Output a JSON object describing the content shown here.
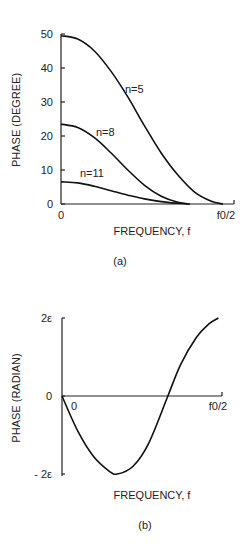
{
  "chart_data": [
    {
      "id": "a",
      "type": "line",
      "caption": "(a)",
      "title": "",
      "xlabel": "FREQUENCY, f",
      "ylabel": "PHASE (DEGREE)",
      "xlim": [
        0,
        1
      ],
      "ylim": [
        0,
        50
      ],
      "x_ticks": [
        {
          "value": 0,
          "label": "0"
        },
        {
          "value": 1,
          "label": "f0/2"
        }
      ],
      "y_ticks": [
        {
          "value": 0,
          "label": "0"
        },
        {
          "value": 10,
          "label": "10"
        },
        {
          "value": 20,
          "label": "20"
        },
        {
          "value": 30,
          "label": "30"
        },
        {
          "value": 40,
          "label": "40"
        },
        {
          "value": 50,
          "label": "50"
        }
      ],
      "grid": false,
      "legend": "inline labels",
      "series": [
        {
          "name": "n=5",
          "x": [
            0,
            0.1,
            0.2,
            0.3,
            0.4,
            0.5,
            0.6,
            0.7,
            0.8,
            0.9,
            0.97
          ],
          "values": [
            49.5,
            48.5,
            45,
            39,
            31.5,
            23,
            15,
            8.5,
            3.5,
            0.8,
            0
          ]
        },
        {
          "name": "n=8",
          "x": [
            0,
            0.1,
            0.2,
            0.3,
            0.4,
            0.5,
            0.6,
            0.7,
            0.77
          ],
          "values": [
            23.5,
            22.5,
            19.5,
            15,
            10,
            5.5,
            2.3,
            0.5,
            0
          ]
        },
        {
          "name": "n=11",
          "x": [
            0,
            0.1,
            0.2,
            0.3,
            0.4,
            0.5,
            0.6,
            0.7,
            0.77
          ],
          "values": [
            6.5,
            6.2,
            5.2,
            3.9,
            2.6,
            1.5,
            0.7,
            0.2,
            0
          ]
        }
      ]
    },
    {
      "id": "b",
      "type": "line",
      "caption": "(b)",
      "title": "",
      "xlabel": "FREQUENCY, f",
      "ylabel": "PHASE (RADIAN)",
      "xlim": [
        0,
        1
      ],
      "ylim": [
        -2,
        2
      ],
      "y_unit": "ε",
      "x_ticks": [
        {
          "value": 0,
          "label": "0"
        },
        {
          "value": 1,
          "label": "f0/2"
        }
      ],
      "y_ticks": [
        {
          "value": 2,
          "label": "2ε"
        },
        {
          "value": 0,
          "label": "0"
        },
        {
          "value": -2,
          "label": "- 2ε"
        }
      ],
      "grid": false,
      "legend": "none",
      "series": [
        {
          "name": "phase",
          "x": [
            0,
            0.1,
            0.2,
            0.3,
            0.35,
            0.45,
            0.55,
            0.67,
            0.75,
            0.85,
            0.93,
            0.99
          ],
          "values": [
            0,
            -0.9,
            -1.55,
            -1.93,
            -2.0,
            -1.8,
            -1.2,
            0,
            0.8,
            1.5,
            1.85,
            2.0
          ]
        }
      ]
    }
  ],
  "layout": {
    "a": {
      "origin_x": 61,
      "origin_y": 204,
      "top_y": 34,
      "x_end": 234,
      "x_data_end": 228,
      "ylabel_x": 20,
      "ylabel_y": 120,
      "xlabel_x": 152,
      "xlabel_y": 235,
      "caption_x": 120,
      "caption_y": 265,
      "curve_labels": [
        {
          "text_path": "0",
          "x": 125,
          "y": 93
        },
        {
          "text_path": "1",
          "x": 96,
          "y": 136
        },
        {
          "text_path": "2",
          "x": 80,
          "y": 177
        }
      ]
    },
    "b": {
      "origin_x": 62,
      "zero_y": 396,
      "top_y": 318,
      "bottom_y": 476,
      "x_end": 222,
      "x_data_end": 220,
      "ylabel_x": 20,
      "ylabel_y": 398,
      "xlabel_x": 152,
      "xlabel_y": 499,
      "caption_x": 145,
      "caption_y": 529
    }
  }
}
